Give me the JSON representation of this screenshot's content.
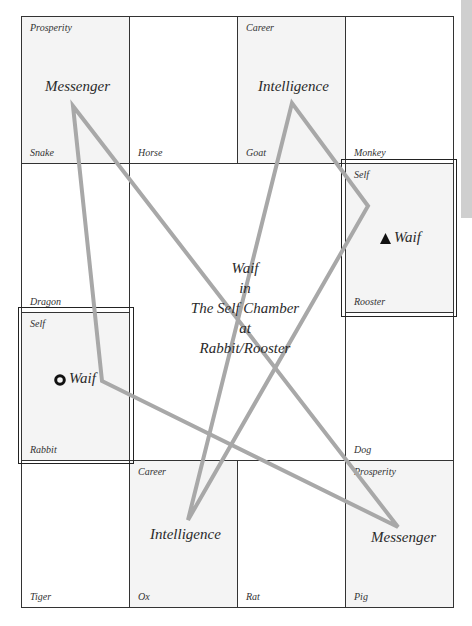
{
  "center": {
    "line1": "Waif",
    "line2": "in",
    "line3": "The Self Chamber",
    "line4": "at",
    "line5": "Rabbit/Rooster"
  },
  "cells": {
    "snake": {
      "animal": "Snake",
      "palace": "Prosperity",
      "star": "Messenger"
    },
    "horse": {
      "animal": "Horse"
    },
    "goat": {
      "animal": "Goat",
      "palace": "Career",
      "star": "Intelligence"
    },
    "monkey": {
      "animal": "Monkey"
    },
    "dragon": {
      "animal": "Dragon"
    },
    "rooster": {
      "animal": "Rooster",
      "palace": "Self",
      "star": "Waif",
      "marker": "triangle"
    },
    "rabbit": {
      "animal": "Rabbit",
      "palace": "Self",
      "star": "Waif",
      "marker": "ring"
    },
    "dog": {
      "animal": "Dog"
    },
    "tiger": {
      "animal": "Tiger"
    },
    "ox": {
      "animal": "Ox",
      "palace": "Career",
      "star": "Intelligence"
    },
    "rat": {
      "animal": "Rat"
    },
    "pig": {
      "animal": "Pig",
      "palace": "Prosperity",
      "star": "Messenger"
    }
  },
  "colors": {
    "grid_line": "#333333",
    "shaded_cell": "#f4f4f4",
    "triangle_stroke": "#a8a8a8",
    "side_tab": "#cfcfcf"
  },
  "triangles": [
    {
      "name": "messenger-waif-triangle",
      "points": "73,106 398,527 102,381"
    },
    {
      "name": "intelligence-triangle",
      "points": "292,103 188,520 368,206"
    }
  ]
}
